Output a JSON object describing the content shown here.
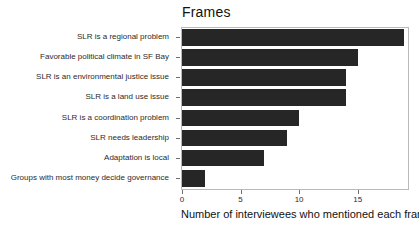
{
  "chart_data": {
    "type": "bar",
    "orientation": "horizontal",
    "title": "Frames",
    "xlabel": "Number of interviewees who mentioned each frame",
    "ylabel": "",
    "categories": [
      "SLR is a regional problem",
      "Favorable political climate in SF Bay",
      "SLR is an environmental justice issue",
      "SLR is a land use issue",
      "SLR is a coordination problem",
      "SLR needs leadership",
      "Adaptation is local",
      "Groups with most money decide governance"
    ],
    "values": [
      19,
      15,
      14,
      14,
      10,
      9,
      7,
      2
    ],
    "xlim": [
      0,
      19.3
    ],
    "xticks": [
      0,
      5,
      10,
      15
    ],
    "xtick_labels": [
      "0",
      "5",
      "10",
      "15"
    ],
    "grid": false,
    "legend": null,
    "bar_color": "#262626",
    "panel_border_color": "#b9b9b9",
    "background_color": "#ffffff"
  }
}
